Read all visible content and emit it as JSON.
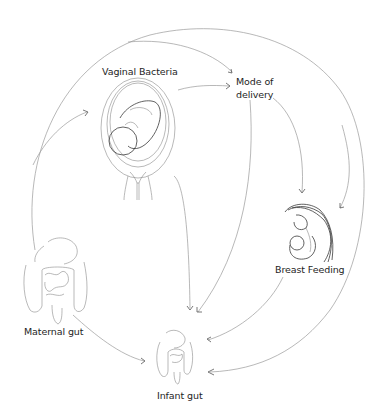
{
  "diagram": {
    "type": "flow",
    "nodes": [
      {
        "id": "vaginal_bacteria",
        "label": "Vaginal Bacteria",
        "icon": "uterus-with-fetus-icon"
      },
      {
        "id": "mode_of_delivery",
        "label": "Mode of\ndelivery"
      },
      {
        "id": "breast_feeding",
        "label": "Breast Feeding",
        "icon": "mother-nursing-infant-icon"
      },
      {
        "id": "maternal_gut",
        "label": "Maternal gut",
        "icon": "maternal-intestines-icon"
      },
      {
        "id": "infant_gut",
        "label": "Infant gut",
        "icon": "infant-intestines-icon"
      }
    ],
    "edges": [
      {
        "from": "maternal_gut",
        "to": "vaginal_bacteria"
      },
      {
        "from": "maternal_gut",
        "to": "mode_of_delivery"
      },
      {
        "from": "maternal_gut",
        "to": "breast_feeding"
      },
      {
        "from": "maternal_gut",
        "to": "infant_gut"
      },
      {
        "from": "maternal_gut",
        "to": "infant_gut",
        "via": "outer-arc"
      },
      {
        "from": "vaginal_bacteria",
        "to": "mode_of_delivery"
      },
      {
        "from": "vaginal_bacteria",
        "to": "infant_gut"
      },
      {
        "from": "mode_of_delivery",
        "to": "breast_feeding"
      },
      {
        "from": "mode_of_delivery",
        "to": "infant_gut"
      },
      {
        "from": "breast_feeding",
        "to": "infant_gut"
      }
    ]
  },
  "labels": {
    "vaginal_bacteria": "Vaginal Bacteria",
    "mode_of_delivery": "Mode of\ndelivery",
    "breast_feeding": "Breast Feeding",
    "maternal_gut": "Maternal gut",
    "infant_gut": "Infant gut"
  },
  "colors": {
    "background": "#ffffff",
    "text": "#1e1e1e",
    "arrow": "#9a9a9a",
    "illustration": "#8a8a8a"
  }
}
